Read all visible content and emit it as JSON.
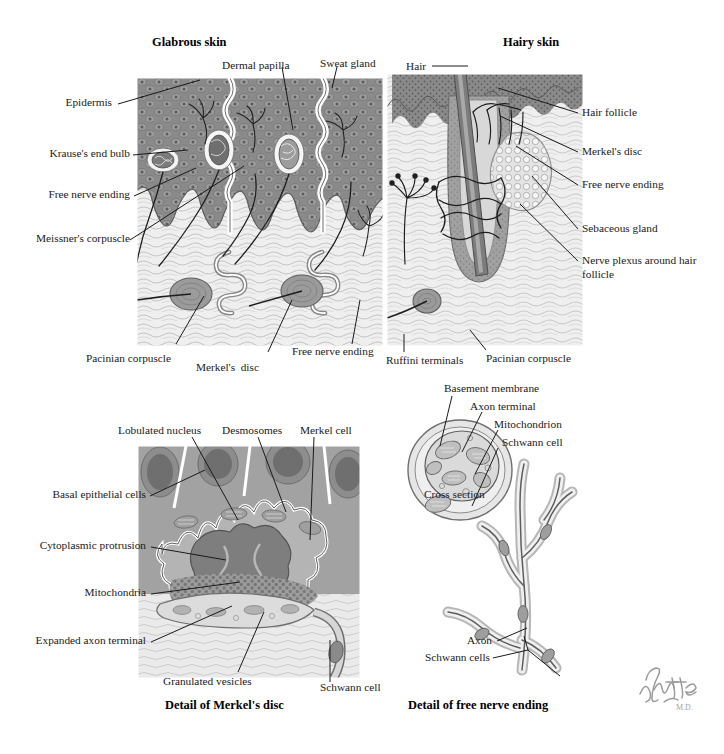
{
  "figure": {
    "style": "netter-medical-illustration",
    "signature": "F. Netter M.D.",
    "palette": {
      "epidermis_dark": "#6f6f6f",
      "epidermis_mid": "#8c8c8c",
      "dermis_light": "#ececec",
      "fiber": "#b9b9b9",
      "ink": "#1a1a1a",
      "cell_body": "#9a9a9a",
      "nucleus": "#6a6a6a",
      "white": "#ffffff"
    }
  },
  "panels": {
    "glabrous": {
      "title": "Glabrous skin",
      "labels": {
        "epidermis": "Epidermis",
        "dermal_papilla": "Dermal papilla",
        "sweat_gland": "Sweat gland",
        "krause": "Krause's end bulb",
        "free_nerve_ending": "Free nerve ending",
        "meissner": "Meissner's corpuscle",
        "pacinian": "Pacinian corpuscle",
        "merkel_disc": "Merkel's  disc",
        "free_nerve_ending_bottom": "Free nerve ending"
      }
    },
    "hairy": {
      "title": "Hairy skin",
      "labels": {
        "hair": "Hair",
        "hair_follicle": "Hair follicle",
        "merkel_disc": "Merkel's disc",
        "free_nerve_ending": "Free nerve ending",
        "sebaceous_gland": "Sebaceous gland",
        "nerve_plexus": "Nerve plexus around hair follicle",
        "ruffini": "Ruffini terminals",
        "pacinian": "Pacinian corpuscle"
      }
    },
    "merkel_detail": {
      "caption": "Detail of Merkel's disc",
      "labels": {
        "lobulated_nucleus": "Lobulated nucleus",
        "desmosomes": "Desmosomes",
        "merkel_cell": "Merkel cell",
        "basal_epithelial_cells": "Basal epithelial cells",
        "cytoplasmic_protrusion": "Cytoplasmic protrusion",
        "mitochondria": "Mitochondria",
        "expanded_axon_terminal": "Expanded axon terminal",
        "granulated_vesicles": "Granulated vesicles",
        "schwann_cell": "Schwann cell"
      }
    },
    "free_nerve_detail": {
      "caption": "Detail of free nerve ending",
      "labels": {
        "basement_membrane": "Basement membrane",
        "axon_terminal": "Axon terminal",
        "mitochondrion": "Mitochondrion",
        "schwann_cell": "Schwann cell",
        "cross_section": "Cross section",
        "axon": "Axon",
        "schwann_cells": "Schwann cells"
      }
    }
  }
}
